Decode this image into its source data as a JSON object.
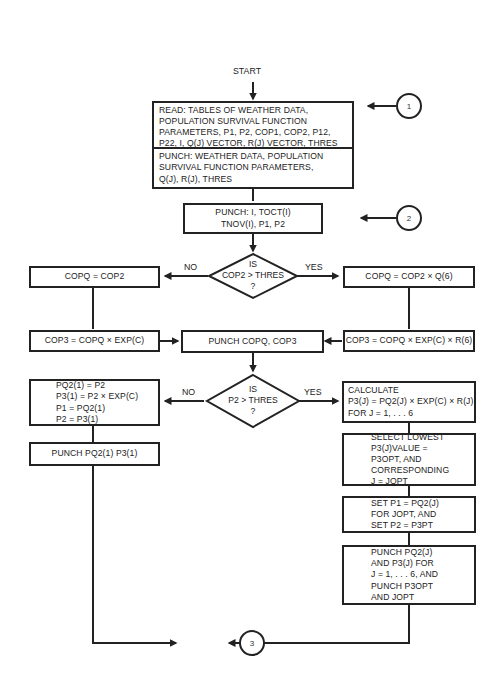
{
  "diagram": {
    "type": "flowchart",
    "start_label": "START",
    "boxes": {
      "read": {
        "lines": [
          "READ:  TABLES OF WEATHER DATA,",
          "POPULATION SURVIVAL FUNCTION",
          "PARAMETERS, P1, P2, COP1, COP2, P12,",
          "P22, I, Q(J) VECTOR, R(J) VECTOR, THRES"
        ]
      },
      "punch_weather": {
        "lines": [
          "PUNCH:  WEATHER DATA, POPULATION",
          "SURVIVAL FUNCTION PARAMETERS,",
          "Q(J), R(J), THRES"
        ]
      },
      "punch_toct": {
        "lines": [
          "PUNCH: I, TOCT(I)",
          "TNOV(I), P1, P2"
        ]
      },
      "copq_cop2": {
        "lines": [
          "COPQ = COP2"
        ]
      },
      "copq_cop2_q6": {
        "lines": [
          "COPQ = COP2 × Q(6)"
        ]
      },
      "cop3_exp": {
        "lines": [
          "COP3 = COPQ × EXP(C)"
        ]
      },
      "punch_copq": {
        "lines": [
          "PUNCH  COPQ,  COP3"
        ]
      },
      "cop3_exp_r6": {
        "lines": [
          "COP3 = COPQ × EXP(C) × R(6)"
        ]
      },
      "pq2_assign": {
        "lines": [
          "PQ2(1) = P2",
          "P3(1) = P2 × EXP(C)",
          "P1 = PQ2(1)",
          "P2 = P3(1)"
        ]
      },
      "punch_pq2_1": {
        "lines": [
          "PUNCH  PQ2(1)  P3(1)"
        ]
      },
      "calculate": {
        "lines": [
          "CALCULATE",
          "P3(J) = PQ2(J) × EXP(C) × R(J)",
          "FOR  J = 1, . . . 6"
        ]
      },
      "select_lowest": {
        "lines": [
          "SELECT  LOWEST",
          "P3(J)VALUE =",
          "P3OPT,  AND",
          "CORRESPONDING",
          "J = JOPT"
        ]
      },
      "set_p1": {
        "lines": [
          "SET  P1 = PQ2(J)",
          "FOR  JOPT,  AND",
          "SET  P2 = P3PT"
        ]
      },
      "punch_final": {
        "lines": [
          "PUNCH  PQ2(J)",
          "AND  P3(J)  FOR",
          "J = 1, . . . 6,  AND",
          "PUNCH  P3OPT",
          "AND  JOPT"
        ]
      }
    },
    "decisions": {
      "cop2": {
        "lines": [
          "IS",
          "COP2 > THRES",
          "?"
        ],
        "no_label": "NO",
        "yes_label": "YES"
      },
      "p2": {
        "lines": [
          "IS",
          "P2 > THRES",
          "?"
        ],
        "no_label": "NO",
        "yes_label": "YES"
      }
    },
    "connectors": {
      "c1": "1",
      "c2": "2",
      "c3": "3"
    }
  }
}
